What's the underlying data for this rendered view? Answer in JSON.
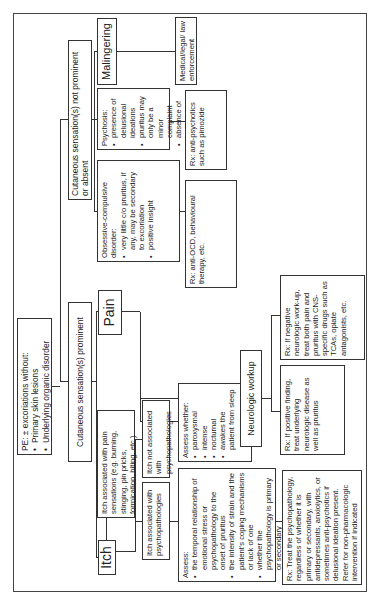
{
  "root": {
    "title": "PE: ± excoriations without:",
    "bullets": [
      "Primary skin lesions",
      "Underlying organic disorder"
    ]
  },
  "branches": {
    "prominent": "Cutaneous sensation(s) prominent",
    "not_prominent": "Cutaneous sensation(s) not prominent or absent"
  },
  "itch": {
    "label": "Itch",
    "with_pain": "Itch associated with pain sensations (e.g. burning, stinging, pin pricks, formication, biting, etc.)",
    "with_psych": "Itch associated with psychopathologies",
    "not_psych": "Itch not associated with psychopathologies",
    "assess_psych": {
      "title": "Assess:",
      "bullets": [
        "the temporal relationship of emotional stress or psychopathology to the onset of pruritus",
        "the intensity of strain and the patient's coping mechanisms or lack of one",
        "whether the psychopathology is primary or secondary"
      ]
    },
    "rx_psych": "Rx: Treat the psychopathology, regardless of whether it is primary or secondary, with antidepressants, anxiolytics, or sometimes anti-psychotics if delusional ideation present. Refer for non-pharmacologic intervention if indicated"
  },
  "pain": {
    "label": "Pain",
    "assess_whether": {
      "title": "Assess whether:",
      "bullets": [
        "paroxysmal",
        "intense",
        "nocturnal",
        "awakes the patient from sleep"
      ]
    },
    "neuro_workup": "Neurologic workup",
    "rx_positive": "Rx: If positive finding, treat underlying neurologic disease as well as pruritus",
    "rx_negative": "Rx: If negative neurologic work-up, treat both pain and pruritus with CNS-specific drugs such as TCAs, opiate antagonists, etc."
  },
  "not_prominent": {
    "ocd": {
      "title": "Obsessive-compulsive disorder:",
      "bullets": [
        "very little c/o pruritus, if any, may be secondary to excoriation",
        "positive insight"
      ]
    },
    "rx_ocd": "Rx: anti-OCD, behavioural therapy, etc.",
    "psychosis": {
      "title": "Psychosis:",
      "bullets": [
        "presence of delusional ideations",
        "pruritus may only be a minor complaint",
        "absence of insight"
      ]
    },
    "rx_psychosis": "Rx: anti-psychotics such as pimozide",
    "malingering": "Malingering",
    "medical_legal": "Medical/legal/ law enforcement"
  }
}
